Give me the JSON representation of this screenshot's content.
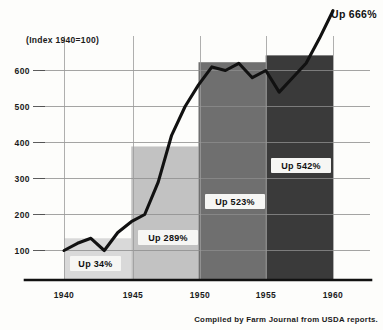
{
  "chart_data": {
    "type": "line",
    "title": "(Index 1940=100)",
    "xlabel": "",
    "ylabel": "",
    "ylim": [
      0,
      700
    ],
    "xlim": [
      1939,
      1961
    ],
    "grid": true,
    "legend": "none",
    "y_ticks": [
      100,
      200,
      300,
      400,
      500,
      600
    ],
    "y_tick_labels": [
      "100",
      "200",
      "300",
      "400",
      "500",
      "600"
    ],
    "x_ticks": [
      1940,
      1945,
      1950,
      1955,
      1960
    ],
    "x_tick_labels": [
      "1940",
      "1945",
      "1950",
      "1955",
      "1960"
    ],
    "series": [
      {
        "name": "Index",
        "x": [
          1940,
          1941,
          1942,
          1943,
          1944,
          1945,
          1946,
          1947,
          1948,
          1949,
          1950,
          1951,
          1952,
          1953,
          1954,
          1955,
          1956,
          1957,
          1958,
          1959,
          1960
        ],
        "values": [
          100,
          120,
          134,
          100,
          150,
          180,
          200,
          290,
          420,
          500,
          560,
          610,
          600,
          620,
          580,
          600,
          540,
          580,
          620,
          690,
          766
        ]
      }
    ],
    "bands": [
      {
        "name": "band-1940-1945",
        "x0": 1940,
        "x1": 1945,
        "top_value": 134,
        "label": "Up 34%",
        "color": "#d9d9d9"
      },
      {
        "name": "band-1945-1950",
        "x0": 1945,
        "x1": 1950,
        "top_value": 389,
        "label": "Up 289%",
        "color": "#c2c2c2"
      },
      {
        "name": "band-1950-1955",
        "x0": 1950,
        "x1": 1955,
        "top_value": 623,
        "label": "Up 523%",
        "color": "#6f6f6f"
      },
      {
        "name": "band-1955-1960",
        "x0": 1955,
        "x1": 1960,
        "top_value": 642,
        "label": "Up 542%",
        "color": "#3a3a3a"
      }
    ],
    "annotations": [
      {
        "name": "endpoint-callout",
        "text": "Up 666%",
        "x": 1960,
        "value": 766
      }
    ],
    "credit": "Compiled by Farm Journal from USDA reports."
  },
  "colors": {
    "line": "#111111",
    "grid": "#8d8d8d",
    "axis": "#111111",
    "background": "#fdfdfb",
    "label_box": "#f6f6f4"
  }
}
